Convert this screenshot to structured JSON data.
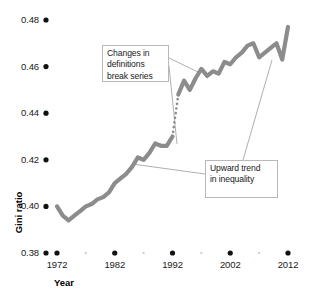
{
  "chart_data": {
    "type": "line",
    "title": "",
    "xlabel": "Year",
    "ylabel": "Gini ratio",
    "xlim": [
      1972,
      2012
    ],
    "ylim": [
      0.38,
      0.48
    ],
    "grid": false,
    "legend": "none",
    "y_ticks": [
      "0.48",
      "0.46",
      "0.44",
      "0.42",
      "0.40",
      "0.38"
    ],
    "y_tick_values": [
      0.48,
      0.46,
      0.44,
      0.42,
      0.4,
      0.38
    ],
    "x_ticks": [
      "1972",
      "1982",
      "1992",
      "2002",
      "2012"
    ],
    "x_tick_values": [
      1972,
      1982,
      1992,
      2002,
      2012
    ],
    "x_minor_ticks": [
      1977,
      1987,
      1997,
      2007
    ],
    "line_color": "#8c8c8c",
    "series": [
      {
        "name": "Gini ratio (pre-break)",
        "style": "solid",
        "x": [
          1972,
          1973,
          1974,
          1975,
          1976,
          1977,
          1978,
          1979,
          1980,
          1981,
          1982,
          1983,
          1984,
          1985,
          1986,
          1987,
          1988,
          1989,
          1990,
          1991,
          1992
        ],
        "values": [
          0.4,
          0.396,
          0.394,
          0.396,
          0.398,
          0.4,
          0.401,
          0.403,
          0.404,
          0.406,
          0.41,
          0.412,
          0.414,
          0.417,
          0.421,
          0.42,
          0.423,
          0.427,
          0.426,
          0.426,
          0.43
        ]
      },
      {
        "name": "Break in series",
        "style": "dotted",
        "x": [
          1992,
          1993
        ],
        "values": [
          0.43,
          0.448
        ]
      },
      {
        "name": "Gini ratio (post-break)",
        "style": "solid",
        "x": [
          1993,
          1994,
          1995,
          1996,
          1997,
          1998,
          1999,
          2000,
          2001,
          2002,
          2003,
          2004,
          2005,
          2006,
          2007,
          2008,
          2009,
          2010,
          2011,
          2012
        ],
        "values": [
          0.448,
          0.454,
          0.45,
          0.455,
          0.459,
          0.456,
          0.458,
          0.457,
          0.462,
          0.461,
          0.464,
          0.466,
          0.469,
          0.47,
          0.464,
          0.466,
          0.468,
          0.47,
          0.463,
          0.477
        ]
      }
    ],
    "annotations": [
      {
        "name": "break-series",
        "lines": [
          "Changes in",
          "definitions",
          "break series"
        ],
        "points_to": "dotted break segment between 1992 and 1993"
      },
      {
        "name": "upward-trend",
        "lines": [
          "Upward trend",
          "in inequality"
        ],
        "points_to": "overall rising line"
      }
    ]
  }
}
